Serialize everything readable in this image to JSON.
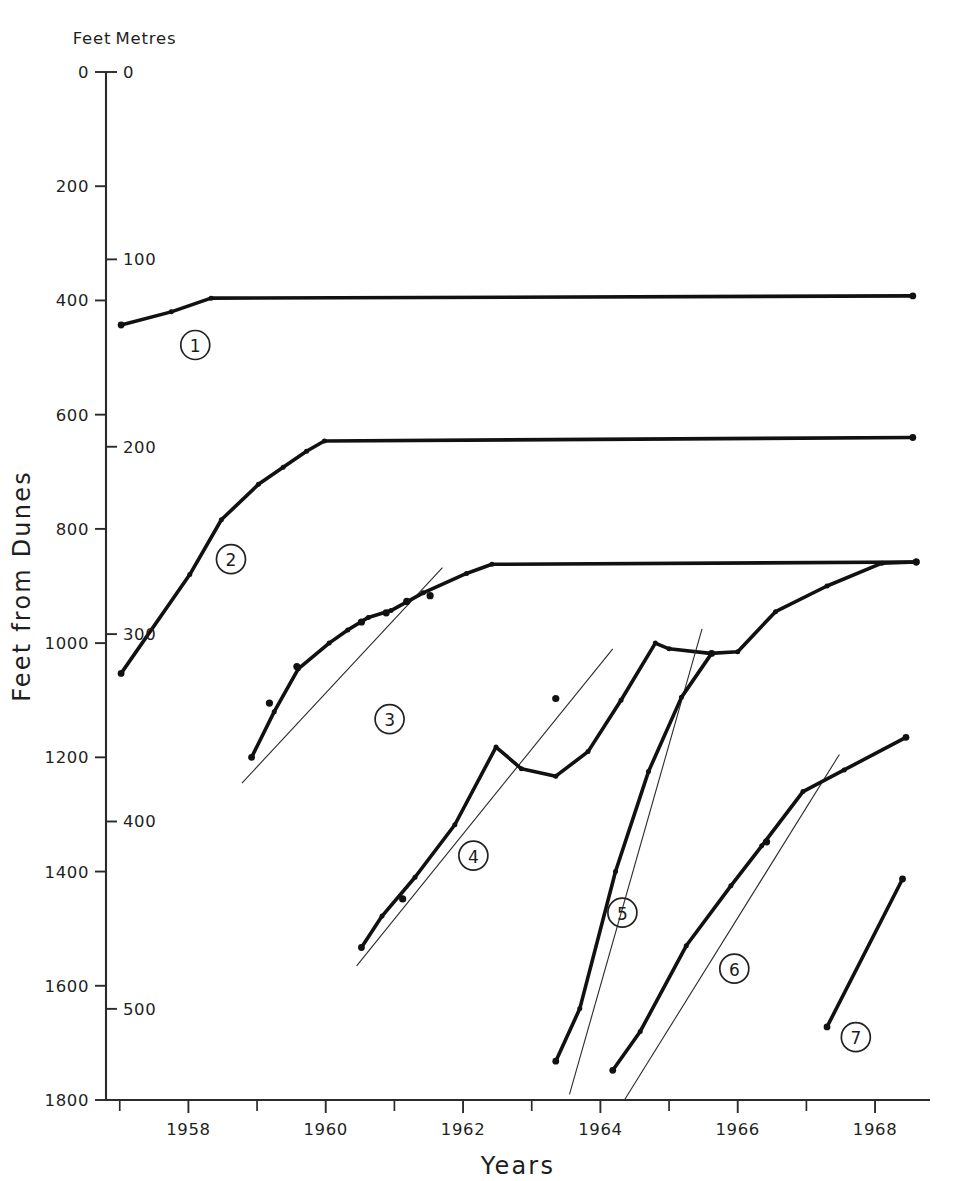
{
  "chart_data": {
    "type": "line",
    "title": "",
    "xlabel": "Years",
    "ylabel": "Feet from Dunes",
    "secondary_ylabel": "Metres",
    "primary_unit_label": "Feet",
    "secondary_unit_label": "Metres",
    "y_inverted": true,
    "grid": false,
    "legend_position": "inline-numbered-markers",
    "xlim": [
      1956.8,
      1968.8
    ],
    "ylim_feet": [
      0,
      1800
    ],
    "ylim_metres": [
      0,
      548.6
    ],
    "x_ticks_major": [
      "1958",
      "1960",
      "1962",
      "1964",
      "1966",
      "1968"
    ],
    "x_ticks_major_values": [
      1958,
      1960,
      1962,
      1964,
      1966,
      1968
    ],
    "x_ticks_minor_values": [
      1957,
      1959,
      1961,
      1963,
      1965,
      1967
    ],
    "y_ticks_feet": [
      "0",
      "200",
      "400",
      "600",
      "800",
      "1000",
      "1200",
      "1400",
      "1600",
      "1800"
    ],
    "y_ticks_feet_values": [
      0,
      200,
      400,
      600,
      800,
      1000,
      1200,
      1400,
      1600,
      1800
    ],
    "y_ticks_metres": [
      "0",
      "100",
      "200",
      "300",
      "400",
      "500"
    ],
    "y_ticks_metres_values": [
      0,
      100,
      200,
      300,
      400,
      500
    ],
    "series": [
      {
        "name": "1",
        "label": "1",
        "label_marker": "circled-number",
        "label_position": {
          "x": 1958.1,
          "y_feet": 478
        },
        "points": [
          {
            "x": 1957.02,
            "y_feet": 443
          },
          {
            "x": 1957.75,
            "y_feet": 420
          },
          {
            "x": 1958.33,
            "y_feet": 396
          },
          {
            "x": 1968.55,
            "y_feet": 392
          }
        ],
        "trend_line": null
      },
      {
        "name": "2",
        "label": "2",
        "label_marker": "circled-number",
        "label_position": {
          "x": 1958.62,
          "y_feet": 853
        },
        "points": [
          {
            "x": 1957.02,
            "y_feet": 1053
          },
          {
            "x": 1958.02,
            "y_feet": 880
          },
          {
            "x": 1958.48,
            "y_feet": 784
          },
          {
            "x": 1959.02,
            "y_feet": 722
          },
          {
            "x": 1959.38,
            "y_feet": 692
          },
          {
            "x": 1959.72,
            "y_feet": 664
          },
          {
            "x": 1959.98,
            "y_feet": 646
          },
          {
            "x": 1968.55,
            "y_feet": 640
          }
        ],
        "trend_line": null
      },
      {
        "name": "3",
        "label": "3",
        "label_marker": "circled-number",
        "label_position": {
          "x": 1960.93,
          "y_feet": 1133
        },
        "points": [
          {
            "x": 1958.92,
            "y_feet": 1200
          },
          {
            "x": 1959.25,
            "y_feet": 1120
          },
          {
            "x": 1959.6,
            "y_feet": 1045
          },
          {
            "x": 1960.05,
            "y_feet": 1000
          },
          {
            "x": 1960.32,
            "y_feet": 977
          },
          {
            "x": 1960.62,
            "y_feet": 955
          },
          {
            "x": 1960.95,
            "y_feet": 943
          },
          {
            "x": 1961.42,
            "y_feet": 912
          },
          {
            "x": 1962.05,
            "y_feet": 878
          },
          {
            "x": 1962.42,
            "y_feet": 862
          },
          {
            "x": 1968.6,
            "y_feet": 858
          }
        ],
        "scatter_points": [
          {
            "x": 1959.18,
            "y_feet": 1105
          },
          {
            "x": 1959.58,
            "y_feet": 1041
          },
          {
            "x": 1960.52,
            "y_feet": 963
          },
          {
            "x": 1960.88,
            "y_feet": 947
          },
          {
            "x": 1961.18,
            "y_feet": 927
          },
          {
            "x": 1961.52,
            "y_feet": 917
          }
        ],
        "trend_line": {
          "x1": 1958.78,
          "y1_feet": 1245,
          "x2": 1961.7,
          "y2_feet": 868
        }
      },
      {
        "name": "4",
        "label": "4",
        "label_marker": "circled-number",
        "label_position": {
          "x": 1962.15,
          "y_feet": 1372
        },
        "points": [
          {
            "x": 1960.52,
            "y_feet": 1533
          },
          {
            "x": 1960.82,
            "y_feet": 1478
          },
          {
            "x": 1961.3,
            "y_feet": 1410
          },
          {
            "x": 1961.88,
            "y_feet": 1318
          },
          {
            "x": 1962.48,
            "y_feet": 1182
          },
          {
            "x": 1962.85,
            "y_feet": 1220
          },
          {
            "x": 1963.35,
            "y_feet": 1233
          },
          {
            "x": 1963.82,
            "y_feet": 1190
          },
          {
            "x": 1964.3,
            "y_feet": 1100
          },
          {
            "x": 1964.8,
            "y_feet": 1000
          },
          {
            "x": 1965.0,
            "y_feet": 1010
          },
          {
            "x": 1965.6,
            "y_feet": 1018
          },
          {
            "x": 1966.0,
            "y_feet": 1015
          },
          {
            "x": 1966.55,
            "y_feet": 945
          },
          {
            "x": 1967.3,
            "y_feet": 900
          },
          {
            "x": 1968.1,
            "y_feet": 860
          },
          {
            "x": 1968.6,
            "y_feet": 858
          }
        ],
        "scatter_points": [
          {
            "x": 1961.12,
            "y_feet": 1448
          },
          {
            "x": 1963.35,
            "y_feet": 1097
          }
        ],
        "trend_line": {
          "x1": 1960.45,
          "y1_feet": 1565,
          "x2": 1964.18,
          "y2_feet": 1010
        }
      },
      {
        "name": "5",
        "label": "5",
        "label_marker": "circled-number",
        "label_position": {
          "x": 1964.32,
          "y_feet": 1472
        },
        "points": [
          {
            "x": 1963.35,
            "y_feet": 1732
          },
          {
            "x": 1963.7,
            "y_feet": 1640
          },
          {
            "x": 1964.22,
            "y_feet": 1400
          },
          {
            "x": 1964.7,
            "y_feet": 1225
          },
          {
            "x": 1965.18,
            "y_feet": 1095
          },
          {
            "x": 1965.62,
            "y_feet": 1018
          }
        ],
        "trend_line": {
          "x1": 1963.55,
          "y1_feet": 1790,
          "x2": 1965.48,
          "y2_feet": 975
        }
      },
      {
        "name": "6",
        "label": "6",
        "label_marker": "circled-number",
        "label_position": {
          "x": 1965.95,
          "y_feet": 1570
        },
        "points": [
          {
            "x": 1964.18,
            "y_feet": 1748
          },
          {
            "x": 1964.58,
            "y_feet": 1680
          },
          {
            "x": 1965.25,
            "y_feet": 1530
          },
          {
            "x": 1965.9,
            "y_feet": 1425
          },
          {
            "x": 1966.35,
            "y_feet": 1355
          },
          {
            "x": 1966.95,
            "y_feet": 1260
          },
          {
            "x": 1967.55,
            "y_feet": 1222
          },
          {
            "x": 1968.45,
            "y_feet": 1165
          }
        ],
        "scatter_points": [
          {
            "x": 1966.42,
            "y_feet": 1348
          }
        ],
        "trend_line": {
          "x1": 1964.35,
          "y1_feet": 1800,
          "x2": 1967.48,
          "y2_feet": 1195
        }
      },
      {
        "name": "7",
        "label": "7",
        "label_marker": "circled-number",
        "label_position": {
          "x": 1967.72,
          "y_feet": 1690
        },
        "points": [
          {
            "x": 1967.3,
            "y_feet": 1672
          },
          {
            "x": 1968.4,
            "y_feet": 1413
          }
        ],
        "trend_line": null
      }
    ]
  },
  "axes": {
    "feet_header": "Feet",
    "metres_header": "Metres",
    "feet_zero": "0",
    "metres_zero": "0",
    "y_title": "Feet from Dunes",
    "x_title": "Years"
  },
  "colors": {
    "ink": "#111111",
    "axis": "#2b2b2b",
    "background": "#ffffff"
  }
}
